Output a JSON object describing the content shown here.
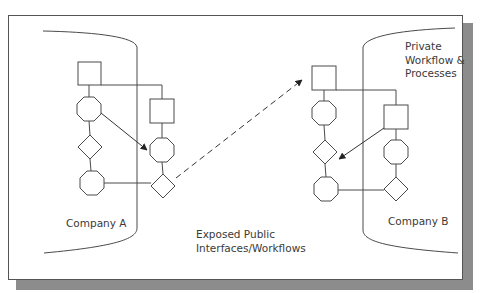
{
  "diagram": {
    "labels": {
      "company_a": "Company A",
      "company_b": "Company B",
      "private": "Private\nWorkflow &\nProcesses",
      "public": "Exposed Public\nInterfaces/Workflows"
    },
    "nodes": {
      "company_a": [
        {
          "id": "a-square-1",
          "shape": "square"
        },
        {
          "id": "a-octagon-1",
          "shape": "octagon"
        },
        {
          "id": "a-diamond-1",
          "shape": "diamond"
        },
        {
          "id": "a-octagon-2",
          "shape": "octagon"
        },
        {
          "id": "a-square-2",
          "shape": "square"
        },
        {
          "id": "a-octagon-3",
          "shape": "octagon"
        },
        {
          "id": "a-diamond-2",
          "shape": "diamond"
        }
      ],
      "company_b": [
        {
          "id": "b-square-1",
          "shape": "square"
        },
        {
          "id": "b-octagon-1",
          "shape": "octagon"
        },
        {
          "id": "b-diamond-1",
          "shape": "diamond"
        },
        {
          "id": "b-octagon-2",
          "shape": "octagon"
        },
        {
          "id": "b-square-2",
          "shape": "square"
        },
        {
          "id": "b-octagon-3",
          "shape": "octagon"
        },
        {
          "id": "b-diamond-2",
          "shape": "diamond"
        }
      ]
    },
    "edges": [
      {
        "from": "a-octagon-1",
        "to": "a-octagon-3",
        "style": "solid-arrow"
      },
      {
        "from": "a-diamond-2",
        "to": "b-square-1",
        "style": "dashed-arrow"
      },
      {
        "from": "b-square-2",
        "to": "b-diamond-1",
        "style": "solid-arrow"
      }
    ],
    "colors": {
      "stroke": "#4a4a4a",
      "shadow": "#8c8c8c",
      "text": "#3a3a3a"
    }
  }
}
